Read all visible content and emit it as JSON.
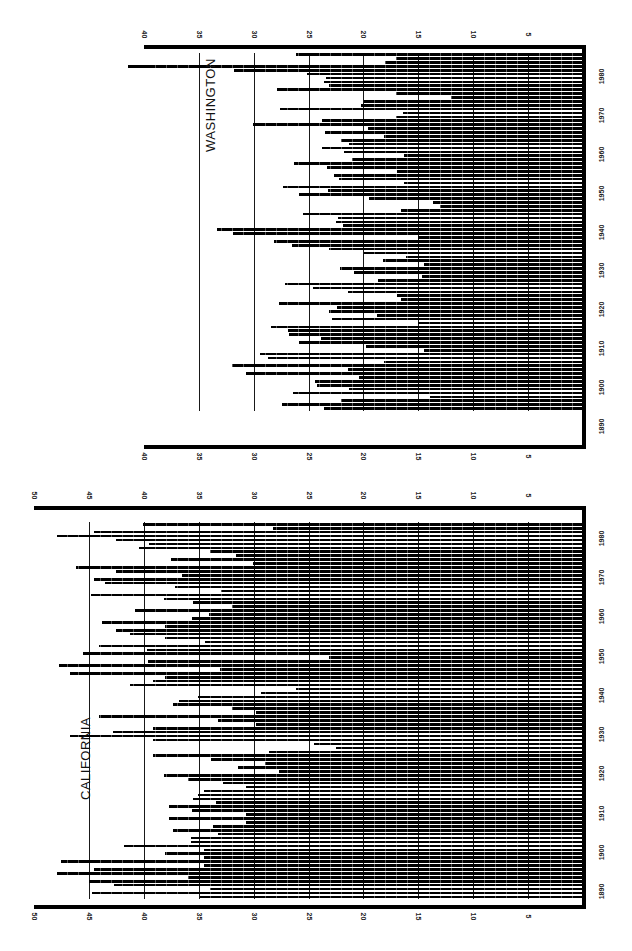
{
  "chart_data": [
    {
      "type": "bar",
      "orientation": "rotated-90",
      "title": "CALIFORNIA",
      "xlabel": "",
      "ylabel": "",
      "ylim": [
        0,
        50
      ],
      "value_ticks": [
        5,
        10,
        15,
        20,
        25,
        30,
        35,
        40,
        45,
        50
      ],
      "year_ticks": [
        1890,
        1900,
        1910,
        1920,
        1930,
        1940,
        1950,
        1960,
        1970,
        1980
      ],
      "start_year": 1889,
      "values": [
        34.9,
        44.7,
        34.0,
        42.7,
        45.0,
        36.0,
        47.9,
        44.5,
        34.5,
        47.5,
        34.5,
        38.1,
        34.5,
        41.8,
        35.7,
        35.7,
        33.2,
        37.3,
        33.7,
        30.7,
        37.7,
        30.7,
        35.6,
        37.7,
        33.4,
        35.5,
        35.1,
        34.5,
        30.7,
        32.8,
        36.0,
        38.2,
        27.7,
        31.4,
        29.0,
        33.9,
        39.2,
        28.6,
        22.5,
        24.5,
        39.2,
        46.7,
        42.8,
        39.2,
        29.8,
        33.2,
        44.1,
        29.8,
        32.0,
        37.3,
        36.8,
        35.1,
        29.3,
        26.1,
        41.3,
        39.2,
        38.1,
        46.7,
        33.1,
        47.7,
        39.6,
        23.1,
        45.5,
        39.7,
        44.1,
        34.4,
        38.1,
        41.3,
        42.5,
        38.1,
        43.8,
        35.6,
        34.1,
        40.8,
        32.0,
        35.5,
        38.2,
        44.8,
        33.0,
        37.2,
        43.5,
        44.5,
        36.5,
        42.5,
        46.2,
        30.1,
        37.5,
        31.6,
        34.0,
        40.4,
        39.5,
        42.5,
        47.9,
        44.5,
        28.2,
        40.1
      ],
      "grid": true,
      "legend": null
    },
    {
      "type": "bar",
      "orientation": "rotated-90",
      "title": "WASHINGTON",
      "xlabel": "",
      "ylabel": "",
      "ylim": [
        0,
        40
      ],
      "value_ticks": [
        5,
        10,
        15,
        20,
        25,
        30,
        35,
        40
      ],
      "year_ticks": [
        1890,
        1900,
        1910,
        1920,
        1930,
        1940,
        1950,
        1960,
        1970,
        1980
      ],
      "start_year": 1895,
      "values": [
        23.6,
        27.4,
        22.0,
        13.9,
        26.4,
        21.3,
        24.2,
        24.4,
        20.4,
        30.7,
        21.4,
        32.0,
        18.1,
        28.7,
        29.4,
        14.5,
        19.8,
        25.9,
        23.9,
        26.8,
        26.9,
        28.4,
        15.0,
        22.9,
        18.8,
        23.1,
        22.4,
        27.7,
        16.6,
        16.9,
        21.4,
        24.6,
        27.1,
        18.7,
        14.7,
        20.9,
        22.1,
        14.5,
        18.2,
        16.1,
        19.9,
        23.1,
        26.5,
        28.1,
        15.0,
        31.9,
        33.3,
        21.9,
        22.5,
        22.3,
        25.5,
        16.6,
        13.0,
        13.7,
        19.5,
        25.9,
        23.2,
        27.3,
        16.3,
        22.2,
        22.7,
        16.9,
        23.3,
        26.3,
        21.0,
        16.3,
        21.8,
        23.8,
        21.3,
        22.0,
        18.1,
        23.5,
        19.6,
        30.1,
        23.8,
        17.0,
        16.4,
        27.6,
        20.2,
        19.9,
        12.0,
        17.0,
        27.9,
        23.1,
        23.6,
        23.4,
        25.1,
        31.8,
        41.4,
        18.0,
        17.0,
        26.1
      ],
      "grid": true,
      "legend": null
    }
  ],
  "labels": {
    "california_title": "CALIFORNIA",
    "washington_title": "WASHINGTON"
  }
}
